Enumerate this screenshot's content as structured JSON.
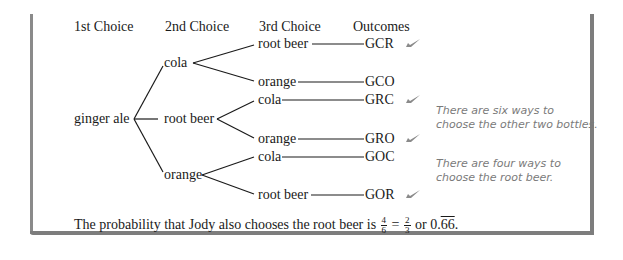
{
  "headers": {
    "first": "1st Choice",
    "second": "2nd Choice",
    "third": "3rd Choice",
    "outcomes": "Outcomes"
  },
  "tree": {
    "root": "ginger ale",
    "branches": [
      {
        "label": "cola",
        "children": [
          {
            "label": "root beer",
            "outcome": "GCR",
            "checked": true
          },
          {
            "label": "orange",
            "outcome": "GCO",
            "checked": false
          }
        ]
      },
      {
        "label": "root beer",
        "children": [
          {
            "label": "cola",
            "outcome": "GRC",
            "checked": true
          },
          {
            "label": "orange",
            "outcome": "GRO",
            "checked": true
          }
        ]
      },
      {
        "label": "orange",
        "children": [
          {
            "label": "cola",
            "outcome": "GOC",
            "checked": false
          },
          {
            "label": "root beer",
            "outcome": "GOR",
            "checked": true
          }
        ]
      }
    ]
  },
  "notes": {
    "six_ways_line1": "There are six ways to",
    "six_ways_line2": "choose the other two bottles.",
    "four_ways_line1": "There are four ways to",
    "four_ways_line2": "choose the root beer."
  },
  "conclusion": {
    "prefix": "The probability that Jody also chooses the root beer is",
    "frac1_num": "4",
    "frac1_den": "6",
    "equals": "=",
    "frac2_num": "2",
    "frac2_den": "3",
    "or": "or",
    "decimal_int": "0.",
    "decimal_repeat": "66",
    "period": "."
  },
  "colors": {
    "frame": "#7d7d7d",
    "note_text": "#7a7a7a",
    "check": "#8a8a8a",
    "text": "#1a1a1a"
  }
}
